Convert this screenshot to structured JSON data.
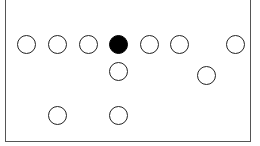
{
  "diagram": {
    "type": "formation",
    "frame": {
      "left": 5,
      "top": -2,
      "width": 246,
      "height": 144
    },
    "circle_diameter": 19,
    "circles": [
      {
        "x": 26,
        "y": 44,
        "filled": false
      },
      {
        "x": 57,
        "y": 44,
        "filled": false
      },
      {
        "x": 88,
        "y": 44,
        "filled": false
      },
      {
        "x": 118,
        "y": 44,
        "filled": true
      },
      {
        "x": 149,
        "y": 44,
        "filled": false
      },
      {
        "x": 179,
        "y": 44,
        "filled": false
      },
      {
        "x": 235,
        "y": 44,
        "filled": false
      },
      {
        "x": 118,
        "y": 71,
        "filled": false
      },
      {
        "x": 206,
        "y": 75,
        "filled": false
      },
      {
        "x": 57,
        "y": 115,
        "filled": false
      },
      {
        "x": 118,
        "y": 115,
        "filled": false
      }
    ],
    "colors": {
      "stroke": "#222222",
      "fill_filled": "#000000",
      "background": "#ffffff"
    }
  }
}
